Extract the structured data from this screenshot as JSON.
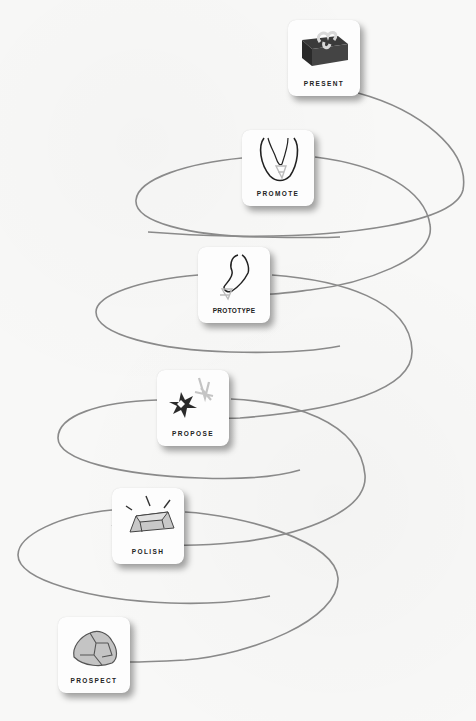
{
  "diagram": {
    "title": "",
    "type": "spiral-process",
    "colors": {
      "background": "#f8f8f7",
      "card": "#fdfdfd",
      "line": "#8a8a8a",
      "label": "#222222"
    },
    "steps": [
      {
        "label": "PROSPECT",
        "icon": "rock-icon"
      },
      {
        "label": "POLISH",
        "icon": "gold-bar-icon"
      },
      {
        "label": "PROPOSE",
        "icon": "spark-ring-icon"
      },
      {
        "label": "PROTOTYPE",
        "icon": "necklace-sketch-icon"
      },
      {
        "label": "PROMOTE",
        "icon": "necklace-icon"
      },
      {
        "label": "PRESENT",
        "icon": "gift-box-icon"
      }
    ]
  }
}
